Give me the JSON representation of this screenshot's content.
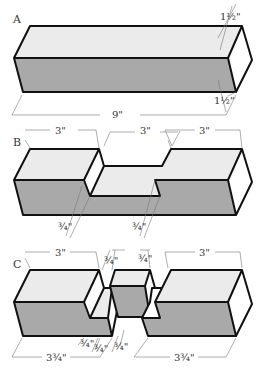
{
  "figure": {
    "sections": [
      {
        "id": "A",
        "label": "A",
        "description": "Solid square bar",
        "dimensions": {
          "length": "9\"",
          "width_top": "1½\"",
          "height_end": "1½\""
        }
      },
      {
        "id": "B",
        "label": "B",
        "description": "Bar divided into three 3-inch segments with center notch cut",
        "dimensions": {
          "segment_left": "3\"",
          "segment_middle": "3\"",
          "segment_right": "3\"",
          "notch_depth_left": "¾\"",
          "notch_depth_right": "¾\""
        }
      },
      {
        "id": "C",
        "label": "C",
        "description": "Bar cut apart into two halves with interlocking half-lap joint",
        "dimensions": {
          "left_block": "3\"",
          "right_block": "3\"",
          "lap_top_left": "¾\"",
          "lap_top_right": "¾\"",
          "lap_bottom_1": "¾\"",
          "lap_bottom_2": "¾\"",
          "lap_bottom_3": "¾\"",
          "left_total": "3¾\"",
          "right_total": "3¾\""
        }
      }
    ],
    "colors": {
      "top_face": "#ebebeb",
      "front_face": "#a9a9a9",
      "end_face": "#ffffff",
      "outline": "#111111"
    }
  }
}
